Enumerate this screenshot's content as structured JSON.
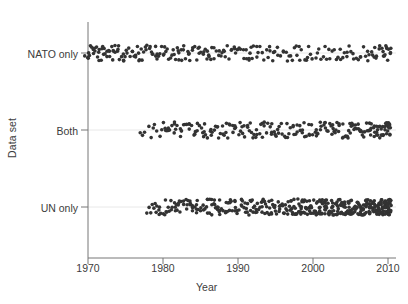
{
  "chart_data": {
    "type": "scatter",
    "title": "",
    "xlabel": "Year",
    "ylabel": "Data set",
    "xlim": [
      1968.5,
      2011.5
    ],
    "xticks": [
      1970,
      1980,
      1990,
      2000,
      2010
    ],
    "xticklabels": [
      "1970",
      "1980",
      "1990",
      "2000",
      "2010"
    ],
    "ycategories": [
      "NATO only",
      "Both",
      "UN only"
    ],
    "grid": "faint-horizontal-category-lines",
    "legend": "none",
    "marker": {
      "shape": "circle",
      "color": "#333333",
      "size": 1.8,
      "jitter_band_px": 16
    },
    "series": [
      {
        "name": "NATO only",
        "category_index": 0,
        "n_points": 232,
        "x_range": [
          1969.6,
          2010.4
        ],
        "description": "Points span the full 1970-2010 range, denser in the 1970s-1990s, sparser after 1995.",
        "x": [
          1969.7,
          1969.9,
          1970.0,
          1970.1,
          1970.2,
          1970.4,
          1970.5,
          1970.6,
          1970.8,
          1970.9,
          1971.0,
          1971.1,
          1971.2,
          1971.3,
          1971.5,
          1971.6,
          1971.7,
          1971.8,
          1972.0,
          1972.1,
          1972.2,
          1972.3,
          1972.5,
          1972.6,
          1972.7,
          1972.9,
          1973.0,
          1973.1,
          1973.3,
          1973.4,
          1973.5,
          1973.7,
          1973.8,
          1974.0,
          1974.1,
          1974.3,
          1974.4,
          1974.6,
          1974.7,
          1974.9,
          1975.0,
          1975.2,
          1975.3,
          1975.5,
          1975.6,
          1975.8,
          1975.9,
          1976.1,
          1976.2,
          1976.4,
          1976.5,
          1976.7,
          1976.8,
          1977.0,
          1977.1,
          1977.3,
          1977.4,
          1977.6,
          1977.8,
          1977.9,
          1978.1,
          1978.2,
          1978.4,
          1978.5,
          1978.7,
          1978.9,
          1979.0,
          1979.2,
          1979.3,
          1979.5,
          1979.7,
          1979.8,
          1980.0,
          1980.1,
          1980.3,
          1980.5,
          1980.6,
          1980.8,
          1981.0,
          1981.1,
          1981.3,
          1981.5,
          1981.6,
          1981.8,
          1982.0,
          1982.1,
          1982.3,
          1982.5,
          1982.6,
          1982.8,
          1983.0,
          1983.2,
          1983.3,
          1983.5,
          1983.7,
          1983.9,
          1984.0,
          1984.2,
          1984.4,
          1984.6,
          1984.7,
          1984.9,
          1985.1,
          1985.3,
          1985.5,
          1985.6,
          1985.8,
          1986.0,
          1986.2,
          1986.4,
          1986.5,
          1986.7,
          1986.9,
          1987.1,
          1987.3,
          1987.5,
          1987.6,
          1987.8,
          1988.0,
          1988.2,
          1988.4,
          1988.6,
          1988.8,
          1989.0,
          1989.2,
          1989.4,
          1989.6,
          1989.8,
          1990.0,
          1990.2,
          1990.4,
          1990.6,
          1990.8,
          1991.0,
          1991.2,
          1991.4,
          1991.6,
          1991.8,
          1992.0,
          1992.2,
          1992.4,
          1992.6,
          1992.8,
          1993.0,
          1993.2,
          1993.5,
          1993.7,
          1993.9,
          1994.1,
          1994.3,
          1994.5,
          1994.8,
          1995.0,
          1995.2,
          1995.4,
          1995.7,
          1995.9,
          1996.1,
          1996.4,
          1996.6,
          1996.8,
          1997.1,
          1997.3,
          1997.6,
          1997.8,
          1998.0,
          1998.3,
          1998.5,
          1998.8,
          1999.0,
          1999.3,
          1999.5,
          1999.8,
          2000.0,
          2000.3,
          2000.5,
          2000.8,
          2001.0,
          2001.3,
          2001.5,
          2001.8,
          2002.0,
          2002.3,
          2002.5,
          2002.8,
          2003.0,
          2003.3,
          2003.5,
          2003.8,
          2004.0,
          2004.3,
          2004.5,
          2004.8,
          2005.0,
          2005.3,
          2005.5,
          2005.8,
          2006.0,
          2006.3,
          2006.5,
          2006.8,
          2007.0,
          2007.2,
          2007.4,
          2007.6,
          2007.8,
          2008.0,
          2008.2,
          2008.4,
          2008.6,
          2008.8,
          2009.0,
          2009.2,
          2009.3,
          2009.5,
          2009.6,
          2009.7,
          2009.8,
          2009.9,
          2010.0,
          2010.1,
          2010.2,
          2010.3,
          2010.4,
          1973.6,
          1981.9,
          1986.1,
          1991.5,
          1998.2,
          2004.6,
          2008.3,
          2009.4
        ]
      },
      {
        "name": "Both",
        "category_index": 1,
        "n_points": 226,
        "x_range": [
          1977.0,
          2010.3
        ],
        "description": "Points begin near 1977, sparse until 1980 then fairly uniform, densest after 2000.",
        "x": [
          1977.0,
          1977.3,
          1977.6,
          1978.0,
          1978.4,
          1978.8,
          1979.2,
          1979.5,
          1979.8,
          1980.0,
          1980.2,
          1980.4,
          1980.6,
          1980.8,
          1981.0,
          1981.2,
          1981.4,
          1981.6,
          1981.8,
          1982.0,
          1982.2,
          1982.4,
          1982.6,
          1982.8,
          1983.0,
          1983.2,
          1983.4,
          1983.6,
          1983.8,
          1984.0,
          1984.2,
          1984.4,
          1984.6,
          1984.8,
          1985.0,
          1985.2,
          1985.4,
          1985.6,
          1985.8,
          1986.0,
          1986.2,
          1986.4,
          1986.6,
          1986.8,
          1987.0,
          1987.2,
          1987.4,
          1987.6,
          1987.8,
          1988.0,
          1988.2,
          1988.4,
          1988.6,
          1988.8,
          1989.0,
          1989.2,
          1989.4,
          1989.6,
          1989.8,
          1990.0,
          1990.2,
          1990.4,
          1990.6,
          1990.8,
          1991.0,
          1991.2,
          1991.4,
          1991.6,
          1991.8,
          1992.0,
          1992.2,
          1992.4,
          1992.6,
          1992.8,
          1993.0,
          1993.2,
          1993.4,
          1993.6,
          1993.8,
          1994.0,
          1994.2,
          1994.4,
          1994.6,
          1994.8,
          1995.0,
          1995.2,
          1995.4,
          1995.6,
          1995.8,
          1996.0,
          1996.2,
          1996.4,
          1996.6,
          1996.8,
          1997.0,
          1997.2,
          1997.4,
          1997.6,
          1997.8,
          1998.0,
          1998.2,
          1998.4,
          1998.6,
          1998.8,
          1999.0,
          1999.2,
          1999.4,
          1999.6,
          1999.8,
          2000.0,
          2000.2,
          2000.4,
          2000.5,
          2000.7,
          2000.9,
          2001.0,
          2001.2,
          2001.4,
          2001.5,
          2001.7,
          2001.9,
          2002.0,
          2002.2,
          2002.3,
          2002.5,
          2002.7,
          2002.8,
          2003.0,
          2003.2,
          2003.3,
          2003.5,
          2003.6,
          2003.8,
          2004.0,
          2004.1,
          2004.3,
          2004.4,
          2004.6,
          2004.8,
          2004.9,
          2005.1,
          2005.2,
          2005.4,
          2005.5,
          2005.7,
          2005.8,
          2006.0,
          2006.1,
          2006.3,
          2006.4,
          2006.6,
          2006.7,
          2006.9,
          2007.0,
          2007.1,
          2007.3,
          2007.4,
          2007.5,
          2007.7,
          2007.8,
          2007.9,
          2008.0,
          2008.2,
          2008.3,
          2008.4,
          2008.5,
          2008.6,
          2008.8,
          2008.9,
          2009.0,
          2009.1,
          2009.2,
          2009.3,
          2009.4,
          2009.5,
          2009.6,
          2009.7,
          2009.8,
          2009.9,
          2010.0,
          2010.1,
          2010.2,
          2010.3,
          1984.5,
          1987.5,
          1990.5,
          1993.5,
          1996.5,
          1999.5,
          2002.5,
          2005.5,
          2006.5,
          2008.5,
          2009.5,
          2010.0,
          1982.5,
          1985.5,
          1988.5,
          1991.5,
          1994.5,
          1997.5,
          2000.5,
          2003.5,
          2004.5,
          2007.5,
          2009.2,
          2010.2,
          1980.5,
          1983.5,
          1986.5,
          1989.5,
          1992.5,
          1995.5,
          1998.5,
          2001.5,
          2005.0,
          2008.1,
          2009.9,
          2010.1,
          1979.0,
          1981.5,
          2006.2,
          2007.6,
          2008.7,
          2009.8,
          2010.3
        ]
      },
      {
        "name": "UN only",
        "category_index": 2,
        "n_points": 420,
        "x_range": [
          1977.8,
          2010.4
        ],
        "description": "Largest group; begins near 1978, builds steadily, very dense and nearly saturated from 1997 to 2010.",
        "x": [
          1977.8,
          1978.1,
          1978.4,
          1978.6,
          1978.8,
          1979.0,
          1979.2,
          1979.4,
          1979.6,
          1979.8,
          1980.0,
          1980.2,
          1980.4,
          1980.6,
          1980.8,
          1981.0,
          1981.1,
          1981.3,
          1981.5,
          1981.7,
          1981.9,
          1982.0,
          1982.2,
          1982.4,
          1982.6,
          1982.8,
          1983.0,
          1983.1,
          1983.3,
          1983.5,
          1983.7,
          1983.9,
          1984.0,
          1984.2,
          1984.4,
          1984.6,
          1984.8,
          1985.0,
          1985.1,
          1985.3,
          1985.5,
          1985.7,
          1985.9,
          1986.0,
          1986.2,
          1986.4,
          1986.6,
          1986.8,
          1987.0,
          1987.1,
          1987.3,
          1987.5,
          1987.7,
          1987.9,
          1988.0,
          1988.2,
          1988.4,
          1988.6,
          1988.8,
          1989.0,
          1989.1,
          1989.3,
          1989.5,
          1989.7,
          1989.9,
          1990.0,
          1990.2,
          1990.4,
          1990.6,
          1990.8,
          1991.0,
          1991.1,
          1991.3,
          1991.5,
          1991.7,
          1991.9,
          1992.0,
          1992.2,
          1992.4,
          1992.6,
          1992.8,
          1993.0,
          1993.1,
          1993.3,
          1993.5,
          1993.7,
          1993.9,
          1994.0,
          1994.2,
          1994.4,
          1994.6,
          1994.8,
          1995.0,
          1995.1,
          1995.3,
          1995.5,
          1995.7,
          1995.9,
          1996.0,
          1996.2,
          1996.4,
          1996.6,
          1996.8,
          1997.0,
          1997.1,
          1997.2,
          1997.3,
          1997.4,
          1997.5,
          1997.6,
          1997.7,
          1997.8,
          1997.9,
          1998.0,
          1998.1,
          1998.2,
          1998.3,
          1998.4,
          1998.5,
          1998.6,
          1998.7,
          1998.8,
          1998.9,
          1999.0,
          1999.1,
          1999.2,
          1999.3,
          1999.4,
          1999.5,
          1999.6,
          1999.7,
          1999.8,
          1999.9,
          2000.0,
          2000.1,
          2000.2,
          2000.3,
          2000.4,
          2000.5,
          2000.6,
          2000.7,
          2000.8,
          2000.9,
          2001.0,
          2001.1,
          2001.2,
          2001.3,
          2001.4,
          2001.5,
          2001.6,
          2001.7,
          2001.8,
          2001.9,
          2002.0,
          2002.1,
          2002.2,
          2002.3,
          2002.4,
          2002.5,
          2002.6,
          2002.7,
          2002.8,
          2002.9,
          2003.0,
          2003.1,
          2003.2,
          2003.3,
          2003.4,
          2003.5,
          2003.6,
          2003.7,
          2003.8,
          2003.9,
          2004.0,
          2004.1,
          2004.2,
          2004.3,
          2004.4,
          2004.5,
          2004.6,
          2004.7,
          2004.8,
          2004.9,
          2005.0,
          2005.1,
          2005.2,
          2005.3,
          2005.4,
          2005.5,
          2005.6,
          2005.7,
          2005.8,
          2005.9,
          2006.0,
          2006.1,
          2006.2,
          2006.3,
          2006.4,
          2006.5,
          2006.6,
          2006.7,
          2006.8,
          2006.9,
          2007.0,
          2007.1,
          2007.2,
          2007.3,
          2007.4,
          2007.5,
          2007.6,
          2007.7,
          2007.8,
          2007.9,
          2008.0,
          2008.1,
          2008.2,
          2008.3,
          2008.4,
          2008.5,
          2008.6,
          2008.7,
          2008.8,
          2008.9,
          2009.0,
          2009.1,
          2009.2,
          2009.3,
          2009.4,
          2009.5,
          2009.6,
          2009.7,
          2009.8,
          2009.9,
          2010.0,
          2010.1,
          2010.2,
          2010.3,
          2010.4,
          1979.5,
          1980.5,
          1981.5,
          1982.5,
          1983.5,
          1984.5,
          1985.5,
          1986.5,
          1987.5,
          1988.5,
          1989.5,
          1990.5,
          1991.5,
          1992.5,
          1993.5,
          1994.5,
          1995.5,
          1996.5,
          1997.5,
          1998.5,
          1999.5,
          2000.5,
          2001.5,
          2002.5,
          2003.5,
          2004.5,
          2005.5,
          2006.5,
          2007.5,
          2008.5,
          2009.5,
          2010.0,
          1980.3,
          1981.8,
          1983.2,
          1984.7,
          1986.1,
          1987.6,
          1989.0,
          1990.5,
          1991.9,
          1993.4,
          1994.8,
          1996.3,
          1997.7,
          1999.2,
          2000.6,
          2002.1,
          2003.5,
          2005.0,
          2006.4,
          2007.9,
          2009.3,
          2010.2,
          1982.1,
          1984.1,
          1986.7,
          1988.3,
          1990.9,
          1992.3,
          1994.3,
          1996.7,
          1998.3,
          1999.7,
          2001.3,
          2002.7,
          2004.3,
          2005.7,
          2007.3,
          2008.7,
          2009.7,
          2010.1,
          1983.8,
          1985.8,
          1988.9,
          1991.2,
          1993.8,
          1995.8,
          1997.4,
          1998.9,
          2000.3,
          2001.9,
          2003.1,
          2004.7,
          2006.1,
          2007.1,
          2008.1,
          2009.1,
          2009.9,
          2010.3,
          1979.1,
          1986.9,
          1992.7,
          1996.1,
          1999.4,
          2002.4,
          2005.3,
          2006.9,
          2008.4,
          2009.6,
          2010.0,
          1987.2,
          1991.6,
          1995.2,
          1998.6,
          2001.1,
          2003.9,
          2006.6,
          2008.8,
          2009.4,
          2010.2,
          1989.6,
          1993.2,
          1997.2,
          2000.8,
          2004.1,
          2007.7,
          2009.2,
          2010.1,
          1994.5,
          1999.8,
          2002.9,
          2005.6,
          2008.2,
          2009.8,
          2010.3,
          1996.9,
          2001.6,
          2004.9,
          2007.4,
          2008.6,
          2009.5,
          2010.0,
          2000.1,
          2003.7,
          2006.3,
          2008.0,
          2009.0,
          2010.4,
          1998.1,
          2002.2,
          2005.4,
          2007.0,
          2008.9,
          2009.9,
          2010.2,
          1995.4,
          2000.9,
          2004.4,
          2006.8,
          2008.3,
          2009.7,
          1999.1,
          2003.3,
          2006.0,
          2007.8,
          2009.3,
          2010.1,
          2001.8,
          2005.1,
          2007.6,
          2009.1,
          2010.3,
          2002.6,
          2006.2,
          2008.5,
          2009.6,
          2010.0,
          2004.6,
          2007.2,
          2008.8,
          2009.4,
          2010.2,
          2003.4,
          2006.6,
          2008.4,
          2009.8,
          2010.1
        ]
      }
    ]
  },
  "axes": {
    "y_axis_title": "Data set",
    "x_axis_title": "Year"
  }
}
